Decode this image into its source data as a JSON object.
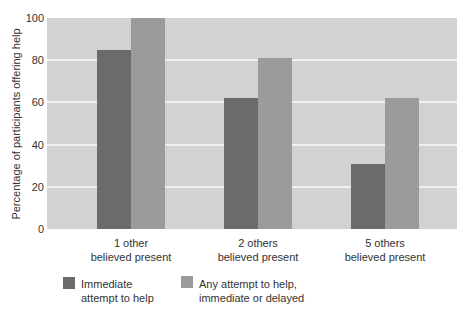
{
  "chart_data": {
    "type": "bar",
    "title": "",
    "xlabel": "",
    "ylabel": "Percentage of participants offering help",
    "ylim": [
      0,
      100
    ],
    "yticks": [
      0,
      20,
      40,
      60,
      80,
      100
    ],
    "grid": true,
    "categories": [
      "1 other believed present",
      "2 others believed present",
      "5 others believed present"
    ],
    "category_lines": [
      [
        "1 other",
        "believed present"
      ],
      [
        "2 others",
        "believed present"
      ],
      [
        "5 others",
        "believed present"
      ]
    ],
    "series": [
      {
        "name": "Immediate attempt to help",
        "color": "#6b6b6b",
        "values": [
          85,
          62,
          31
        ]
      },
      {
        "name": "Any attempt to help, immediate or delayed",
        "color": "#9b9b9b",
        "values": [
          100,
          81,
          62
        ]
      }
    ],
    "legend": {
      "position": "bottom",
      "items": [
        {
          "line1": "Immediate",
          "line2": "attempt to help"
        },
        {
          "line1": "Any attempt to help,",
          "line2": "immediate or delayed"
        }
      ]
    }
  }
}
